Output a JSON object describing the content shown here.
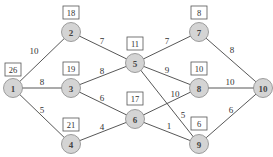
{
  "header": {
    "clipped_text": ""
  },
  "graph": {
    "nodes": [
      {
        "id": "1",
        "x": 13,
        "y": 88,
        "box": "26",
        "bx": 13,
        "by": 70
      },
      {
        "id": "2",
        "x": 71,
        "y": 32,
        "box": "18",
        "bx": 71,
        "by": 13
      },
      {
        "id": "3",
        "x": 71,
        "y": 88,
        "box": "19",
        "bx": 71,
        "by": 69
      },
      {
        "id": "4",
        "x": 71,
        "y": 144,
        "box": "21",
        "bx": 71,
        "by": 125
      },
      {
        "id": "5",
        "x": 135,
        "y": 63,
        "box": "11",
        "bx": 135,
        "by": 44
      },
      {
        "id": "6",
        "x": 135,
        "y": 119,
        "box": "17",
        "bx": 135,
        "by": 99
      },
      {
        "id": "7",
        "x": 199,
        "y": 32,
        "box": "8",
        "bx": 199,
        "by": 13
      },
      {
        "id": "8",
        "x": 199,
        "y": 88,
        "box": "10",
        "bx": 199,
        "by": 69
      },
      {
        "id": "9",
        "x": 199,
        "y": 144,
        "box": "6",
        "bx": 199,
        "by": 124
      },
      {
        "id": "10",
        "x": 263,
        "y": 88,
        "box": null
      }
    ],
    "edges": [
      {
        "from": "1",
        "to": "2",
        "w": "10",
        "lx": 34,
        "ly": 51
      },
      {
        "from": "1",
        "to": "3",
        "w": "8",
        "lx": 42,
        "ly": 82
      },
      {
        "from": "1",
        "to": "4",
        "w": "5",
        "lx": 42,
        "ly": 110
      },
      {
        "from": "2",
        "to": "5",
        "w": "7",
        "lx": 102,
        "ly": 41
      },
      {
        "from": "3",
        "to": "5",
        "w": "8",
        "lx": 102,
        "ly": 71
      },
      {
        "from": "3",
        "to": "6",
        "w": "6",
        "lx": 102,
        "ly": 98
      },
      {
        "from": "4",
        "to": "6",
        "w": "4",
        "lx": 102,
        "ly": 127
      },
      {
        "from": "5",
        "to": "7",
        "w": "7",
        "lx": 167,
        "ly": 41
      },
      {
        "from": "5",
        "to": "8",
        "w": "9",
        "lx": 167,
        "ly": 70
      },
      {
        "from": "5",
        "to": "9",
        "w": "5",
        "lx": 183,
        "ly": 115
      },
      {
        "from": "6",
        "to": "8",
        "w": "10",
        "lx": 175,
        "ly": 94
      },
      {
        "from": "6",
        "to": "9",
        "w": "1",
        "lx": 169,
        "ly": 126
      },
      {
        "from": "7",
        "to": "10",
        "w": "8",
        "lx": 232,
        "ly": 50
      },
      {
        "from": "8",
        "to": "10",
        "w": "10",
        "lx": 230,
        "ly": 82
      },
      {
        "from": "9",
        "to": "10",
        "w": "6",
        "lx": 231,
        "ly": 110
      }
    ]
  }
}
